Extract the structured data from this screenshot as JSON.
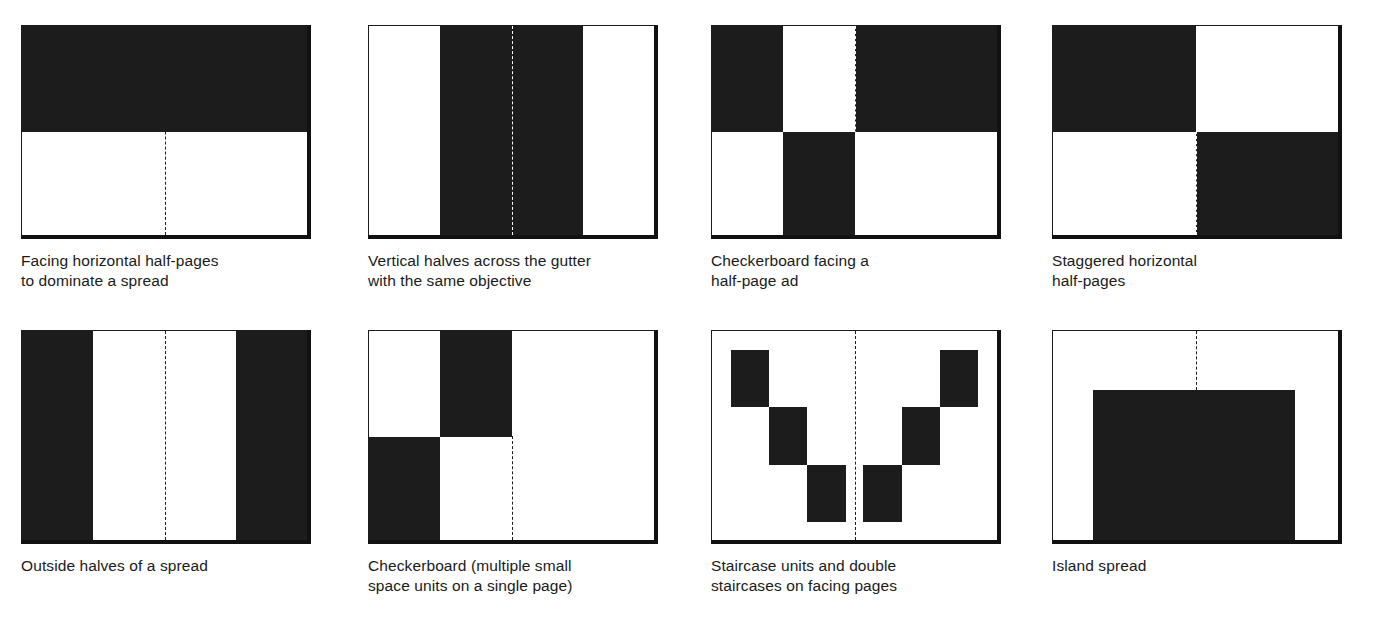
{
  "page": {
    "background_color": "#ffffff",
    "ink_color": "#1c1c1c",
    "figure_count": 8
  },
  "figures": [
    {
      "id": "facing-horizontal-half-pages",
      "caption": "Facing horizontal half-pages\nto dominate a spread",
      "gutter": true,
      "gutter_style": "dashed-full",
      "blocks_description": "Full-width black band across the top half of both pages"
    },
    {
      "id": "vertical-halves-across-gutter",
      "caption": "Vertical halves across the gutter\nwith the same objective",
      "gutter": true,
      "gutter_style": "dashed-full-over-black",
      "blocks_description": "Black vertical band spanning the inner half of both pages, centred on the gutter"
    },
    {
      "id": "checkerboard-facing-half-page-ad",
      "caption": "Checkerboard facing a\nhalf-page ad",
      "gutter": true,
      "gutter_style": "dashed-full",
      "blocks_description": "Left page checkerboard quarters plus a full right-page top half"
    },
    {
      "id": "staggered-horizontal-half-pages",
      "caption": "Staggered horizontal\nhalf-pages",
      "gutter": true,
      "gutter_style": "dashed-full",
      "blocks_description": "Top-left and bottom-right half-pages black, diagonally staggered"
    },
    {
      "id": "outside-halves-of-a-spread",
      "caption": "Outside halves of a spread",
      "gutter": true,
      "gutter_style": "dashed-full",
      "blocks_description": "Black vertical bands on the outer edge of each page"
    },
    {
      "id": "checkerboard-single-page",
      "caption": "Checkerboard (multiple small\nspace units on a single page)",
      "gutter": true,
      "gutter_style": "dashed-full",
      "blocks_description": "Two small diagonal quarter-units on the left page only"
    },
    {
      "id": "staircase-units-facing-pages",
      "caption": "Staircase units and double\nstaircases on facing pages",
      "gutter": true,
      "gutter_style": "dashed-full",
      "blocks_description": "Three descending blocks on the left page mirrored by three ascending blocks on the right"
    },
    {
      "id": "island-spread",
      "caption": "Island spread",
      "gutter": true,
      "gutter_style": "dashed-top-only",
      "blocks_description": "A single centred black rectangle floating across the gutter, anchored at the foot"
    }
  ]
}
